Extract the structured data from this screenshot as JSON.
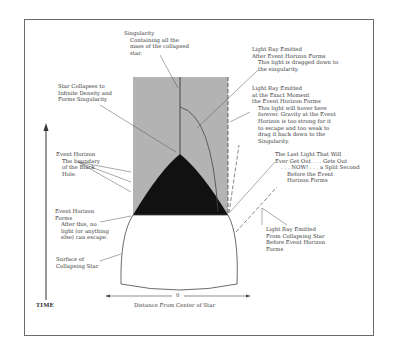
{
  "diagram": {
    "axes": {
      "time_label": "TIME",
      "distance_label": "Distance From Center of Star",
      "distance_origin": "0"
    },
    "labels": {
      "singularity": {
        "title": "Singularity",
        "lines": [
          "Containing all the",
          "mass of the collapsed",
          "star."
        ]
      },
      "light_after": {
        "title_lines": [
          "Light Ray Emitted",
          "After Event Horizon Forms"
        ],
        "lines": [
          "This light is dragged down to",
          "the singularity."
        ]
      },
      "star_collapses": {
        "lines": [
          "Star Collapses to",
          "Infinite Density and",
          "Forms Singularity"
        ]
      },
      "light_exact": {
        "title_lines": [
          "Light Ray Emitted",
          "at the Exact Moment",
          "the Event Horizon Forms"
        ],
        "lines": [
          "This light will hover here",
          "forever. Gravity at the Event",
          "Horizon is too strong for it",
          "to escape and too weak to",
          "drag it back down to the",
          "Singularity."
        ]
      },
      "event_horizon": {
        "title": "Event Horizon",
        "lines": [
          "The boundary",
          "of the Black",
          "Hole."
        ]
      },
      "last_light": {
        "title_lines": [
          "The Last Light That Will",
          "Ever Get Out . . . Gets Out"
        ],
        "lines": [
          ". . . NOW! . . . a Split Second",
          "Before the Event",
          "Horizon Forms"
        ]
      },
      "event_horizon_forms": {
        "title_lines": [
          "Event Horizon",
          "Forms"
        ],
        "lines": [
          "After this, no",
          "light (or anything",
          "else) can escape."
        ]
      },
      "light_before": {
        "lines": [
          "Light Ray Emitted",
          "From Collapsing Star",
          "Before Event Horizon",
          "Forms"
        ]
      },
      "surface": {
        "lines": [
          "Surface of",
          "Collapsing Star"
        ]
      }
    },
    "colors": {
      "black_hole_region": "#b3b3b3",
      "collapsed_star": "#111111",
      "star_surface": "#ffffff",
      "line": "#555555",
      "frame": "#6a6a6a"
    }
  }
}
